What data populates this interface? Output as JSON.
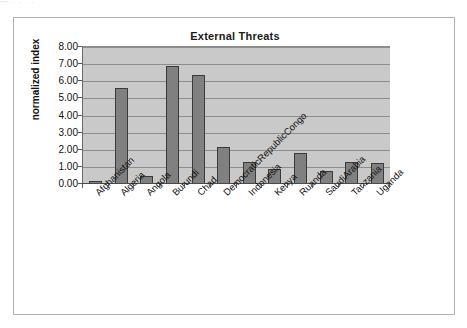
{
  "scan_artifact": "—  .    .              .   .",
  "chart": {
    "title": "External Threats",
    "y_axis_title": "normalized index",
    "y_ticks": [
      "0.00",
      "1.00",
      "2.00",
      "3.00",
      "4.00",
      "5.00",
      "6.00",
      "7.00",
      "8.00"
    ]
  },
  "chart_data": {
    "type": "bar",
    "title": "External Threats",
    "xlabel": "",
    "ylabel": "normalized index",
    "ylim": [
      0,
      8
    ],
    "ytick_step": 1,
    "grid": true,
    "legend": false,
    "categories": [
      "Afghanistan",
      "Algeria",
      "Angola",
      "Burundi",
      "Chad",
      "DemocraticRepublicCongo",
      "Indonesia",
      "Kenya",
      "Ruanda",
      "SaudiArabia",
      "Tanzania",
      "Uganda"
    ],
    "values": [
      0.15,
      5.6,
      0.45,
      6.9,
      6.35,
      2.15,
      1.3,
      0.9,
      1.8,
      0.75,
      1.3,
      1.2
    ],
    "colors": {
      "bar_fill": "#808080",
      "bar_border": "#3a3a3a",
      "plot_background": "#c9c9c9",
      "gridline": "#8d8d8d",
      "frame_border": "#b0b0b0",
      "text": "#111111"
    }
  }
}
